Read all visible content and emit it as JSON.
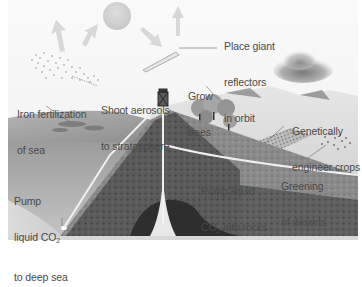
{
  "diagram": {
    "title": "",
    "colors": {
      "sky": "#f4f4f4",
      "sun": "#cfcfcf",
      "arrow": "#d6d6d6",
      "sea_surface": "#a9a9a9",
      "rock_light": "#9a9a9a",
      "rock_dark": "#4a4a4a",
      "pipe": "#f2f2f2",
      "text": "#4a4a4a"
    },
    "labels": {
      "reflectors": {
        "line1": "Place giant",
        "line2": "reflectors",
        "line3": "in orbit"
      },
      "aerosols": {
        "line1": "Shoot aerosols",
        "line2": "to stratosphere"
      },
      "iron": {
        "line1": "Iron fertilization",
        "line2": "of sea"
      },
      "trees": {
        "line1": "Grow",
        "line2": "trees"
      },
      "crops": {
        "line1": "Genetically",
        "line2": "engineer crops"
      },
      "deserts": {
        "line1": "Greening",
        "line2": "of deserts"
      },
      "pump_rocks": {
        "line1": "Pump liquid",
        "line2_pre": "CO",
        "line2_sub": "2",
        "line2_post": " into rocks"
      },
      "pump_sea": {
        "line1": "Pump",
        "line2_pre": "liquid CO",
        "line2_sub": "2",
        "line3": "to deep sea"
      }
    }
  }
}
